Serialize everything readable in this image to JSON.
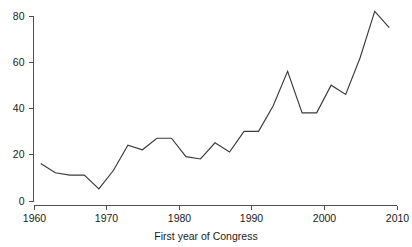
{
  "chart_data": {
    "type": "line",
    "title": "",
    "subtitle": "",
    "xlabel": "First year of Congress",
    "ylabel": "",
    "xlim": [
      1960,
      2010
    ],
    "ylim": [
      0,
      85
    ],
    "grid": false,
    "legend": null,
    "x_ticks": [
      1960,
      1970,
      1980,
      1990,
      2000,
      2010
    ],
    "x_tick_labels": [
      "1960",
      "1970",
      "1980",
      "1990",
      "2000",
      "2010"
    ],
    "y_ticks": [
      0,
      20,
      40,
      60,
      80
    ],
    "y_tick_labels": [
      "0",
      "20",
      "40",
      "60",
      "80"
    ],
    "line_color": "#3a3a3a",
    "axis_color": "#4d4d4d",
    "background_color": "#ffffff",
    "x": [
      1961,
      1963,
      1965,
      1967,
      1969,
      1971,
      1973,
      1975,
      1977,
      1979,
      1981,
      1983,
      1985,
      1987,
      1989,
      1991,
      1993,
      1995,
      1997,
      1999,
      2001,
      2003,
      2005,
      2007,
      2009
    ],
    "values": [
      16,
      12,
      11,
      11,
      5,
      13,
      24,
      22,
      27,
      27,
      19,
      18,
      25,
      21,
      30,
      30,
      41,
      56,
      38,
      38,
      50,
      46,
      62,
      82,
      75
    ],
    "series": [
      {
        "name": "",
        "x": [
          1961,
          1963,
          1965,
          1967,
          1969,
          1971,
          1973,
          1975,
          1977,
          1979,
          1981,
          1983,
          1985,
          1987,
          1989,
          1991,
          1993,
          1995,
          1997,
          1999,
          2001,
          2003,
          2005,
          2007,
          2009
        ],
        "values": [
          16,
          12,
          11,
          11,
          5,
          13,
          24,
          22,
          27,
          27,
          19,
          18,
          25,
          21,
          30,
          30,
          41,
          56,
          38,
          38,
          50,
          46,
          62,
          82,
          75
        ]
      }
    ]
  },
  "axis": {
    "x_title": "First year of Congress"
  }
}
